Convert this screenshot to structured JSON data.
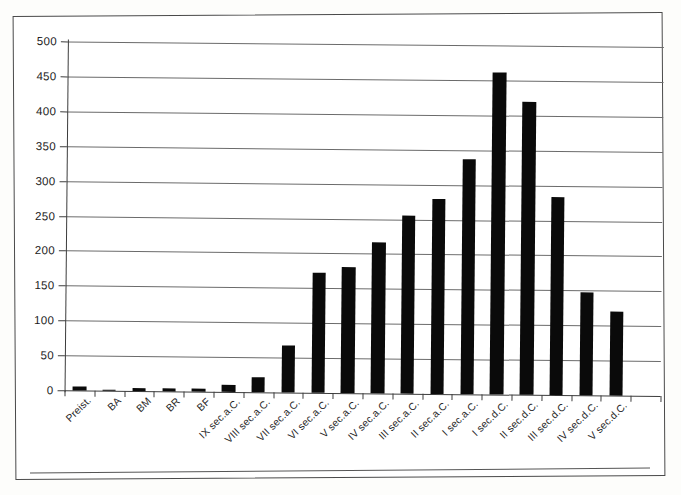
{
  "chart_data": {
    "type": "bar",
    "title": "",
    "subtitle": "",
    "xlabel": "",
    "ylabel": "",
    "ylim": [
      0,
      500
    ],
    "ytick_step": 50,
    "yticks": [
      0,
      50,
      100,
      150,
      200,
      250,
      300,
      350,
      400,
      450,
      500
    ],
    "grid": true,
    "legend": false,
    "bar_color": "#0a0a0a",
    "categories": [
      "Preist.",
      "BA",
      "BM",
      "BR",
      "BF",
      "IX sec.a.C.",
      "VIII sec.a.C.",
      "VII sec.a.C.",
      "VI sec.a.C.",
      "V sec.a.C.",
      "IV sec.a.C.",
      "III sec.a.C.",
      "II sec.a.C.",
      "I sec.a.C.",
      "I sec.d.C.",
      "II sec.d.C.",
      "III sec.d.C.",
      "IV sec.d.C.",
      "V sec.d.C.",
      "V sec.d.C."
    ],
    "values": [
      6,
      2,
      5,
      5,
      4,
      10,
      21,
      67,
      172,
      181,
      216,
      255,
      280,
      336,
      462,
      420,
      283,
      147,
      121,
      0
    ]
  },
  "figure": {
    "frame_color": "#4a4a4a",
    "axis_color": "#3c3c3c",
    "gridline_color": "#6b6b6b",
    "background": "#ffffff"
  }
}
